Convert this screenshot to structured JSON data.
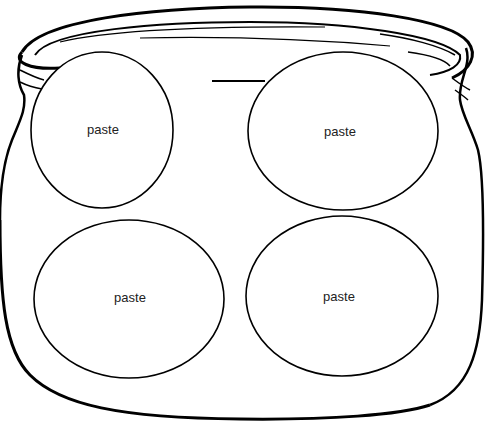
{
  "worksheet": {
    "subject": "jar",
    "ovals": [
      {
        "label": "paste",
        "cx": 102,
        "cy": 130,
        "rx": 71,
        "ry": 78
      },
      {
        "label": "paste",
        "cx": 343,
        "cy": 131,
        "rx": 95,
        "ry": 79
      },
      {
        "label": "paste",
        "cx": 129,
        "cy": 299,
        "rx": 95,
        "ry": 79
      },
      {
        "label": "paste",
        "cx": 342,
        "cy": 296,
        "rx": 96,
        "ry": 80
      }
    ],
    "colors": {
      "line": "#000000",
      "background": "#ffffff",
      "text": "#222222"
    }
  }
}
